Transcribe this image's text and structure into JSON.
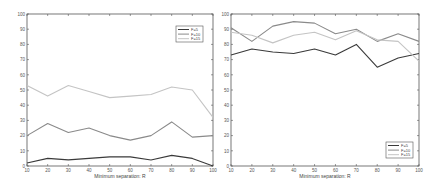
{
  "chart_data": [
    {
      "type": "line",
      "title": "",
      "xlabel": "Minimum separation: R",
      "ylabel": "",
      "x": [
        10,
        20,
        30,
        40,
        50,
        60,
        70,
        80,
        90,
        100
      ],
      "xlim": [
        10,
        100
      ],
      "ylim": [
        0,
        100
      ],
      "xticks": [
        "10",
        "20",
        "30",
        "40",
        "50",
        "60",
        "70",
        "80",
        "90",
        "100"
      ],
      "yticks": [
        "0",
        "10",
        "20",
        "30",
        "40",
        "50",
        "60",
        "70",
        "80",
        "90",
        "100"
      ],
      "grid": false,
      "legend_position": "upper right",
      "series": [
        {
          "name": "F=5",
          "color": "#3a3a3a",
          "values": [
            2,
            5,
            4,
            5,
            6,
            6,
            4,
            7,
            5,
            0
          ]
        },
        {
          "name": "F=10",
          "color": "#8a8a8a",
          "values": [
            20,
            28,
            22,
            25,
            20,
            17,
            20,
            29,
            19,
            20
          ]
        },
        {
          "name": "F=15",
          "color": "#c4c4c4",
          "values": [
            53,
            46,
            53,
            49,
            45,
            46,
            47,
            52,
            50,
            32
          ]
        }
      ]
    },
    {
      "type": "line",
      "title": "",
      "xlabel": "Minimum separation: R",
      "ylabel": "",
      "x": [
        10,
        20,
        30,
        40,
        50,
        60,
        70,
        80,
        90,
        100
      ],
      "xlim": [
        10,
        100
      ],
      "ylim": [
        0,
        100
      ],
      "xticks": [
        "10",
        "20",
        "30",
        "40",
        "50",
        "60",
        "70",
        "80",
        "90",
        "100"
      ],
      "yticks": [
        "0",
        "10",
        "20",
        "30",
        "40",
        "50",
        "60",
        "70",
        "80",
        "90",
        "100"
      ],
      "grid": false,
      "legend_position": "lower right",
      "series": [
        {
          "name": "F=5",
          "color": "#3a3a3a",
          "values": [
            73,
            77,
            75,
            74,
            77,
            73,
            80,
            65,
            71,
            74
          ]
        },
        {
          "name": "F=10",
          "color": "#8a8a8a",
          "values": [
            91,
            82,
            92,
            95,
            94,
            87,
            90,
            82,
            87,
            82
          ]
        },
        {
          "name": "F=15",
          "color": "#c4c4c4",
          "values": [
            88,
            86,
            81,
            86,
            88,
            83,
            89,
            83,
            82,
            69
          ]
        }
      ]
    }
  ]
}
